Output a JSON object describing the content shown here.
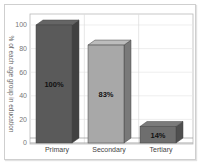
{
  "chart_data": {
    "type": "bar",
    "style": "3d",
    "title": "",
    "xlabel": "",
    "ylabel": "% of each age group in education",
    "categories": [
      "Primary",
      "Secondary",
      "Tertiary"
    ],
    "values": [
      100,
      83,
      14
    ],
    "value_labels": [
      "100%",
      "83%",
      "14%"
    ],
    "ylim": [
      0,
      100
    ],
    "yticks": [
      0,
      20,
      40,
      60,
      80,
      100
    ],
    "grid": true,
    "legend": null,
    "colors": [
      "#5a5a5a",
      "#a8a8a8",
      "#6e6e6e"
    ]
  }
}
